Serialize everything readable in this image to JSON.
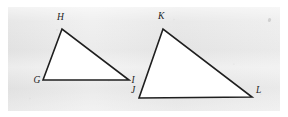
{
  "figure": {
    "caption": "",
    "background_color": "#ffffff",
    "plate_color": "#e9e9e9",
    "stroke_color": "#1f1f1f",
    "fill_color": "#ffffff",
    "stroke_width": 1.6
  },
  "triangles": [
    {
      "id": "triangle-ghi",
      "name": "GHI",
      "vertices": [
        {
          "label": "G",
          "x": 43,
          "y": 80,
          "label_x": 33.5,
          "label_y": 75.5
        },
        {
          "label": "H",
          "x": 62,
          "y": 29,
          "label_x": 57.0,
          "label_y": 12.5
        },
        {
          "label": "I",
          "x": 129,
          "y": 80,
          "label_x": 131.5,
          "label_y": 75.5
        }
      ],
      "points_attr": "43,80 62,29 129,80"
    },
    {
      "id": "triangle-jkl",
      "name": "JKL",
      "vertices": [
        {
          "label": "J",
          "x": 139,
          "y": 98,
          "label_x": 131.0,
          "label_y": 85.5
        },
        {
          "label": "K",
          "x": 163,
          "y": 29,
          "label_x": 158.0,
          "label_y": 12.0
        },
        {
          "label": "L",
          "x": 252,
          "y": 97,
          "label_x": 256.0,
          "label_y": 86.0
        }
      ],
      "points_attr": "139,98 163,29 252,97"
    }
  ]
}
